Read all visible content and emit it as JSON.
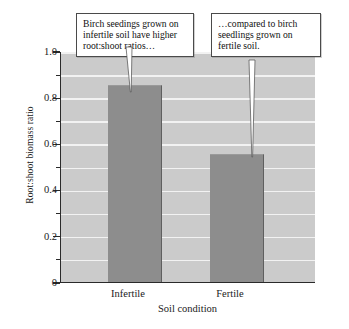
{
  "chart_data": {
    "type": "bar",
    "title": "",
    "categories": [
      "Infertile",
      "Fertile"
    ],
    "values": [
      0.855,
      0.555
    ],
    "xlabel": "Soil condition",
    "ylabel": "Root:shoot biomass ratio",
    "ylim": [
      0,
      1.0
    ],
    "ytick_labels": [
      "0",
      "0.2",
      "0.4",
      "0.6",
      "0.8",
      "1.0"
    ],
    "ytick_values": [
      0,
      0.2,
      0.4,
      0.6,
      0.8,
      1.0
    ],
    "yminor_tick_values": [
      0.1,
      0.3,
      0.5,
      0.7,
      0.9
    ],
    "gridlines": [
      0.1,
      0.2,
      0.3,
      0.4,
      0.5,
      0.6,
      0.7,
      0.8,
      0.9,
      1.0
    ],
    "grid": true,
    "legend": "none",
    "bar_color": "#8d8d8d",
    "plot_background": "#cbcbcb",
    "gridline_color": "#f2f2f2",
    "axis_color": "#2a2a2a",
    "annotations": [
      {
        "name": "infertile-callout",
        "text": "Birch seedings grown on infertile soil have higher root:shoot ratios…",
        "points_to_category": "Infertile"
      },
      {
        "name": "fertile-callout",
        "text": "…compared to birch seedlings grown on fertile soil.",
        "points_to_category": "Fertile"
      }
    ]
  },
  "caption": {
    "figure_number": "",
    "text": ""
  }
}
